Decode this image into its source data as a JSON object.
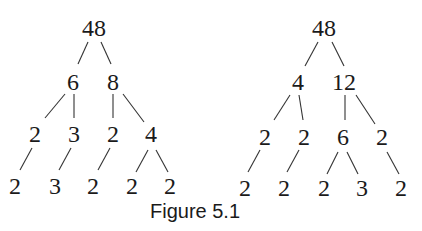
{
  "caption": "Figure 5.1",
  "trees": [
    {
      "name": "left-tree",
      "nodes": [
        {
          "id": "a",
          "label": "48",
          "x": 94,
          "y": 36
        },
        {
          "id": "b",
          "label": "6",
          "x": 73,
          "y": 90
        },
        {
          "id": "c",
          "label": "8",
          "x": 113,
          "y": 90
        },
        {
          "id": "d",
          "label": "2",
          "x": 35,
          "y": 142
        },
        {
          "id": "e",
          "label": "3",
          "x": 74,
          "y": 142
        },
        {
          "id": "f",
          "label": "2",
          "x": 113,
          "y": 142
        },
        {
          "id": "g",
          "label": "4",
          "x": 151,
          "y": 142
        },
        {
          "id": "h",
          "label": "2",
          "x": 15,
          "y": 194
        },
        {
          "id": "i",
          "label": "3",
          "x": 55,
          "y": 194
        },
        {
          "id": "j",
          "label": "2",
          "x": 93,
          "y": 194
        },
        {
          "id": "k",
          "label": "2",
          "x": 132,
          "y": 194
        },
        {
          "id": "l",
          "label": "2",
          "x": 170,
          "y": 194
        }
      ],
      "edges": [
        [
          88,
          42,
          78,
          64
        ],
        [
          101,
          42,
          111,
          64
        ],
        [
          65,
          94,
          45,
          118
        ],
        [
          74,
          94,
          74,
          118
        ],
        [
          113,
          94,
          113,
          118
        ],
        [
          123,
          94,
          144,
          122
        ],
        [
          32,
          148,
          20,
          170
        ],
        [
          71,
          148,
          59,
          170
        ],
        [
          110,
          148,
          98,
          170
        ],
        [
          148,
          150,
          136,
          172
        ],
        [
          156,
          150,
          168,
          172
        ]
      ]
    },
    {
      "name": "right-tree",
      "nodes": [
        {
          "id": "a",
          "label": "48",
          "x": 324,
          "y": 36
        },
        {
          "id": "b",
          "label": "4",
          "x": 298,
          "y": 90
        },
        {
          "id": "c",
          "label": "12",
          "x": 344,
          "y": 90
        },
        {
          "id": "d",
          "label": "2",
          "x": 265,
          "y": 145
        },
        {
          "id": "e",
          "label": "2",
          "x": 304,
          "y": 145
        },
        {
          "id": "f",
          "label": "6",
          "x": 343,
          "y": 145
        },
        {
          "id": "g",
          "label": "2",
          "x": 382,
          "y": 145
        },
        {
          "id": "h",
          "label": "2",
          "x": 245,
          "y": 196
        },
        {
          "id": "i",
          "label": "2",
          "x": 284,
          "y": 196
        },
        {
          "id": "j",
          "label": "2",
          "x": 324,
          "y": 196
        },
        {
          "id": "k",
          "label": "3",
          "x": 362,
          "y": 196
        },
        {
          "id": "l",
          "label": "2",
          "x": 401,
          "y": 196
        }
      ],
      "edges": [
        [
          318,
          42,
          305,
          66
        ],
        [
          332,
          42,
          344,
          66
        ],
        [
          290,
          95,
          274,
          120
        ],
        [
          299,
          95,
          303,
          120
        ],
        [
          345,
          95,
          345,
          120
        ],
        [
          356,
          95,
          375,
          124
        ],
        [
          260,
          150,
          248,
          172
        ],
        [
          299,
          150,
          287,
          172
        ],
        [
          338,
          152,
          327,
          174
        ],
        [
          347,
          152,
          358,
          174
        ],
        [
          387,
          152,
          399,
          174
        ]
      ]
    }
  ]
}
